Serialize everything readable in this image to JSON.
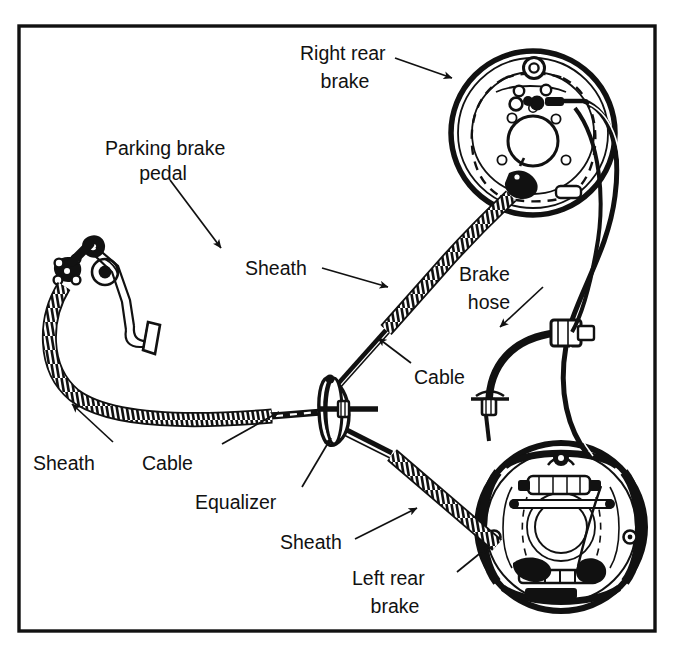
{
  "figure": {
    "border_color": "#111111",
    "line_color": "#111111",
    "background": "#ffffff"
  },
  "labels": {
    "parking_brake_pedal_l1": "Parking brake",
    "parking_brake_pedal_l2": "pedal",
    "right_rear_brake_l1": "Right rear",
    "right_rear_brake_l2": "brake",
    "sheath_upper": "Sheath",
    "brake_hose_l1": "Brake",
    "brake_hose_l2": "hose",
    "cable_right": "Cable",
    "sheath_left": "Sheath",
    "cable_left": "Cable",
    "equalizer": "Equalizer",
    "sheath_lower": "Sheath",
    "left_rear_brake_l1": "Left rear",
    "left_rear_brake_l2": "brake"
  },
  "components": [
    {
      "name": "parking-brake-pedal",
      "label": "Parking brake pedal"
    },
    {
      "name": "right-rear-brake",
      "label": "Right rear brake"
    },
    {
      "name": "left-rear-brake",
      "label": "Left rear brake"
    },
    {
      "name": "equalizer",
      "label": "Equalizer"
    },
    {
      "name": "brake-hose",
      "label": "Brake hose"
    },
    {
      "name": "cable",
      "label": "Cable"
    },
    {
      "name": "sheath",
      "label": "Sheath"
    }
  ]
}
